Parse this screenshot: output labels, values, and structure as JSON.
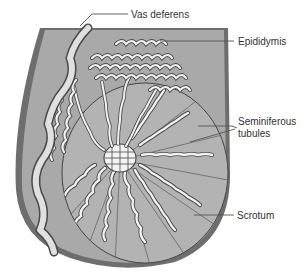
{
  "diagram": {
    "labels": {
      "vas_deferens": "Vas deferens",
      "epididymis": "Epididymis",
      "seminiferous_line1": "Seminiferous",
      "seminiferous_line2": "tubules",
      "scrotum": "Scrotum"
    },
    "colors": {
      "scrotum_outer": "#6e6e6e",
      "scrotum_fill": "#a9a9a9",
      "testis_fill": "#b8b8b8",
      "tubule_fill": "#f2f2f2",
      "tubule_outline": "#4a4a4a",
      "leader_line": "#555555",
      "label_text": "#333333"
    }
  }
}
